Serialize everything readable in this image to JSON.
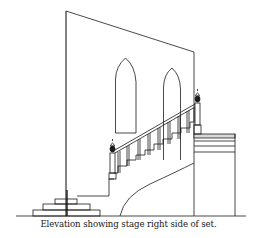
{
  "caption": "Elevation showing stage right side of set.",
  "figure": {
    "type": "architectural elevation line drawing",
    "elements": [
      "back wall with slanted top",
      "two gothic arched windows",
      "curved staircase with balustrade and handrail",
      "two newel posts with finials",
      "upper landing platform with layered edge",
      "three-tier step unit at lower left",
      "vertical masking flat line",
      "stage floor ground line"
    ]
  },
  "colors": {
    "line": "#1a1a1a",
    "background": "#ffffff"
  }
}
